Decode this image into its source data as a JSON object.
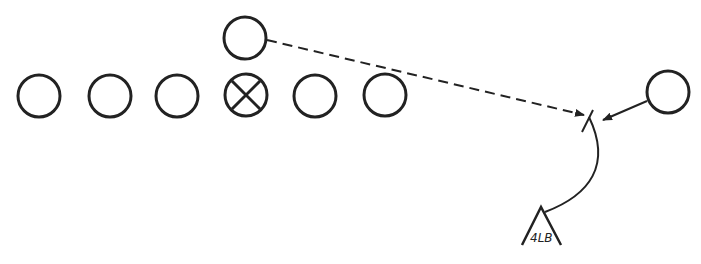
{
  "diagram": {
    "type": "football-play-diagram",
    "stroke_color": "#222222",
    "background": "#ffffff",
    "offensive_line": [
      {
        "id": "player-1",
        "cx": 39,
        "cy": 96,
        "marker": "circle"
      },
      {
        "id": "player-2",
        "cx": 110,
        "cy": 96,
        "marker": "circle"
      },
      {
        "id": "player-3",
        "cx": 177,
        "cy": 96,
        "marker": "circle"
      },
      {
        "id": "center",
        "cx": 246,
        "cy": 96,
        "marker": "circle-x"
      },
      {
        "id": "player-5",
        "cx": 315,
        "cy": 96,
        "marker": "circle"
      },
      {
        "id": "player-6",
        "cx": 385,
        "cy": 96,
        "marker": "circle"
      }
    ],
    "backfield": [
      {
        "id": "back",
        "cx": 245,
        "cy": 38,
        "marker": "circle"
      }
    ],
    "wide_player": {
      "id": "wide",
      "cx": 668,
      "cy": 92,
      "marker": "circle"
    },
    "defender": {
      "id": "linebacker",
      "label": "4LB",
      "marker": "triangle"
    },
    "routes": [
      {
        "from": "back",
        "style": "dashed",
        "arrow": true
      },
      {
        "from": "wide",
        "style": "solid",
        "arrow": true
      },
      {
        "from": "linebacker",
        "style": "curved-solid",
        "arrow": false
      }
    ]
  }
}
